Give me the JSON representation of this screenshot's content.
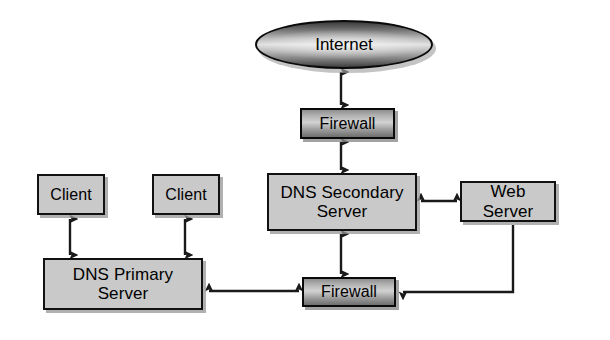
{
  "diagram": {
    "background_color": "#ffffff",
    "node_fill_light": "#c9c9c9",
    "node_border_color": "#111111",
    "connector_color": "#1a1a1a"
  },
  "nodes": {
    "internet": {
      "label": "Internet",
      "shape": "ellipse",
      "fill": "gradient-dark"
    },
    "firewall_top": {
      "label": "Firewall",
      "shape": "rect",
      "fill": "gradient-dark"
    },
    "dns_secondary": {
      "label": "DNS Secondary\nServer",
      "shape": "rect",
      "fill": "#c9c9c9"
    },
    "web_server": {
      "label": "Web Server",
      "shape": "rect",
      "fill": "#c9c9c9"
    },
    "client_1": {
      "label": "Client",
      "shape": "rect",
      "fill": "#c9c9c9"
    },
    "client_2": {
      "label": "Client",
      "shape": "rect",
      "fill": "#c9c9c9"
    },
    "dns_primary": {
      "label": "DNS Primary\nServer",
      "shape": "rect",
      "fill": "#c9c9c9"
    },
    "firewall_bottom": {
      "label": "Firewall",
      "shape": "rect",
      "fill": "gradient-dark"
    }
  },
  "connectors": [
    {
      "id": "internet-firewall-top",
      "from": "internet",
      "to": "firewall_top",
      "arrows": "both",
      "orientation": "vertical"
    },
    {
      "id": "firewall-top-dns-secondary",
      "from": "firewall_top",
      "to": "dns_secondary",
      "arrows": "both",
      "orientation": "vertical"
    },
    {
      "id": "dns-secondary-web-server",
      "from": "dns_secondary",
      "to": "web_server",
      "arrows": "both",
      "orientation": "horizontal"
    },
    {
      "id": "dns-secondary-firewall-bottom",
      "from": "dns_secondary",
      "to": "firewall_bottom",
      "arrows": "both",
      "orientation": "vertical"
    },
    {
      "id": "client-1-dns-primary",
      "from": "client_1",
      "to": "dns_primary",
      "arrows": "both",
      "orientation": "vertical"
    },
    {
      "id": "client-2-dns-primary",
      "from": "client_2",
      "to": "dns_primary",
      "arrows": "both",
      "orientation": "vertical"
    },
    {
      "id": "dns-primary-firewall-bottom",
      "from": "dns_primary",
      "to": "firewall_bottom",
      "arrows": "both",
      "orientation": "horizontal"
    },
    {
      "id": "web-server-firewall-bottom",
      "from": "web_server",
      "to": "firewall_bottom",
      "arrows": "single",
      "orientation": "elbow"
    }
  ]
}
